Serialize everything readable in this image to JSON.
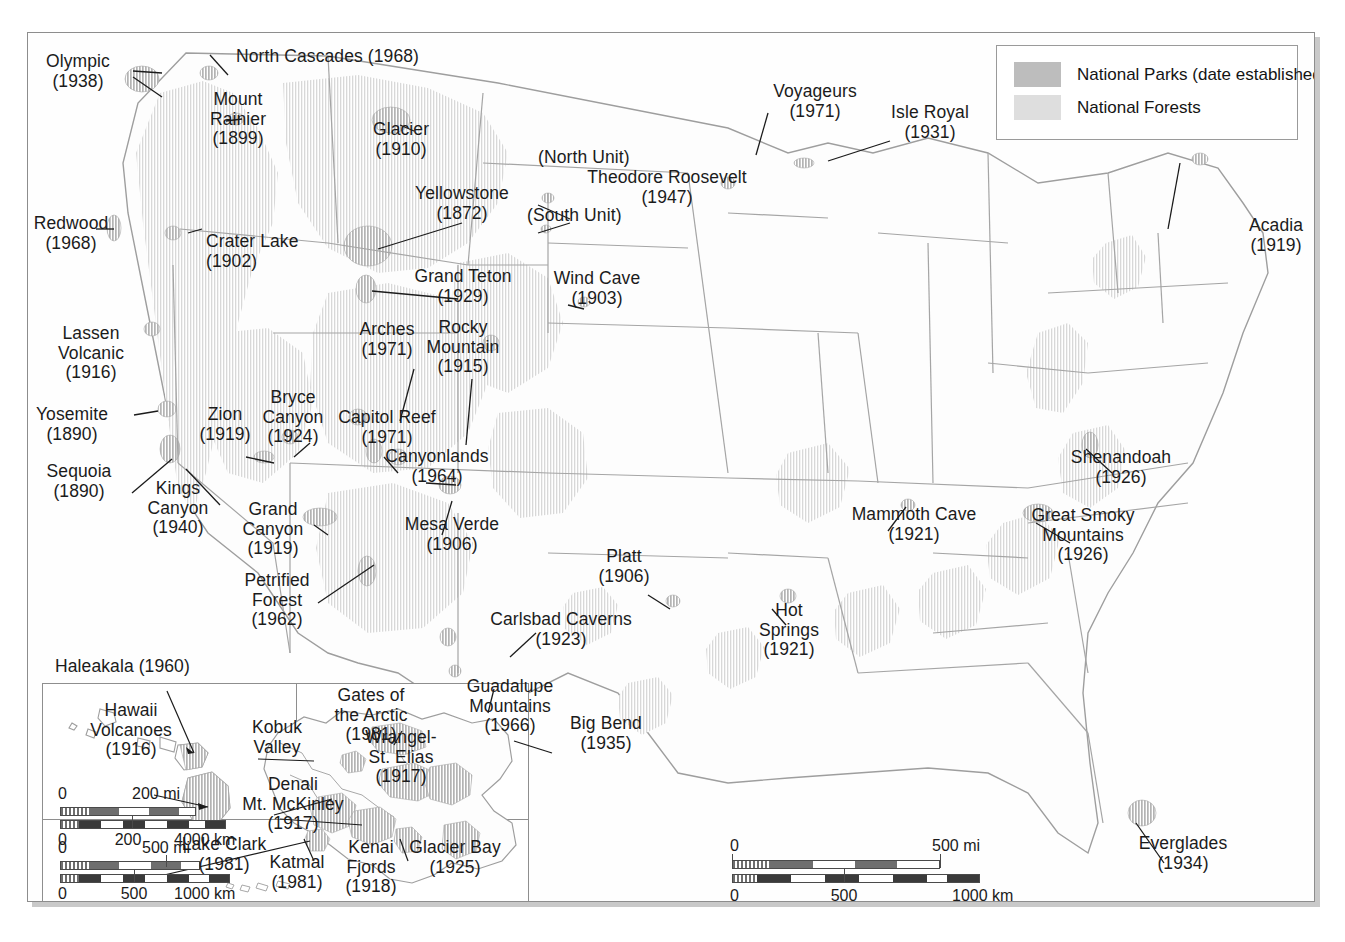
{
  "legend": {
    "items": [
      {
        "label": "National Parks (date established)",
        "color": "#bdbdbd",
        "icon": "park-swatch"
      },
      {
        "label": "National Forests",
        "color": "#dedede",
        "icon": "forest-swatch"
      }
    ]
  },
  "parks": [
    {
      "name": "Olympic",
      "year": "(1938)",
      "x": 78,
      "y": 52,
      "align": "c"
    },
    {
      "name": "North Cascades (1968)",
      "year": "",
      "x": 236,
      "y": 47,
      "align": "l"
    },
    {
      "name": "Mount\nRainier",
      "year": "(1899)",
      "x": 238,
      "y": 90,
      "align": "c"
    },
    {
      "name": "Glacier",
      "year": "(1910)",
      "x": 401,
      "y": 120,
      "align": "c"
    },
    {
      "name": "Voyageurs",
      "year": "(1971)",
      "x": 815,
      "y": 82,
      "align": "c"
    },
    {
      "name": "Isle Royal",
      "year": "(1931)",
      "x": 930,
      "y": 103,
      "align": "c"
    },
    {
      "name": "(North Unit)",
      "year": "",
      "x": 538,
      "y": 148,
      "align": "l"
    },
    {
      "name": "Theodore Roosevelt",
      "year": "(1947)",
      "x": 667,
      "y": 168,
      "align": "c"
    },
    {
      "name": "(South Unit)",
      "year": "",
      "x": 527,
      "y": 206,
      "align": "l"
    },
    {
      "name": "Yellowstone",
      "year": "(1872)",
      "x": 462,
      "y": 184,
      "align": "c"
    },
    {
      "name": "Acadia",
      "year": "(1919)",
      "x": 1276,
      "y": 216,
      "align": "c"
    },
    {
      "name": "Redwood",
      "year": "(1968)",
      "x": 71,
      "y": 214,
      "align": "c"
    },
    {
      "name": "Crater Lake",
      "year": "(1902)",
      "x": 206,
      "y": 232,
      "align": "l"
    },
    {
      "name": "Grand Teton",
      "year": "(1929)",
      "x": 463,
      "y": 267,
      "align": "c"
    },
    {
      "name": "Wind Cave",
      "year": "(1903)",
      "x": 597,
      "y": 269,
      "align": "c"
    },
    {
      "name": "Lassen\nVolcanic",
      "year": "(1916)",
      "x": 91,
      "y": 324,
      "align": "c"
    },
    {
      "name": "Arches",
      "year": "(1971)",
      "x": 387,
      "y": 320,
      "align": "c"
    },
    {
      "name": "Rocky\nMountain",
      "year": "(1915)",
      "x": 463,
      "y": 318,
      "align": "c"
    },
    {
      "name": "Yosemite",
      "year": "(1890)",
      "x": 72,
      "y": 405,
      "align": "c"
    },
    {
      "name": "Bryce\nCanyon",
      "year": "(1924)",
      "x": 293,
      "y": 388,
      "align": "c"
    },
    {
      "name": "Zion",
      "year": "(1919)",
      "x": 225,
      "y": 405,
      "align": "c"
    },
    {
      "name": "Capitol Reef",
      "year": "(1971)",
      "x": 387,
      "y": 408,
      "align": "c"
    },
    {
      "name": "Canyonlands",
      "year": "(1964)",
      "x": 437,
      "y": 447,
      "align": "c"
    },
    {
      "name": "Sequoia",
      "year": "(1890)",
      "x": 79,
      "y": 462,
      "align": "c"
    },
    {
      "name": "Kings\nCanyon",
      "year": "(1940)",
      "x": 178,
      "y": 479,
      "align": "c"
    },
    {
      "name": "Shenandoah",
      "year": "(1926)",
      "x": 1121,
      "y": 448,
      "align": "c"
    },
    {
      "name": "Grand\nCanyon",
      "year": "(1919)",
      "x": 273,
      "y": 500,
      "align": "c"
    },
    {
      "name": "Mesa Verde",
      "year": "(1906)",
      "x": 452,
      "y": 515,
      "align": "c"
    },
    {
      "name": "Mammoth Cave",
      "year": "(1921)",
      "x": 914,
      "y": 505,
      "align": "c"
    },
    {
      "name": "Great Smoky\nMountains",
      "year": "(1926)",
      "x": 1083,
      "y": 506,
      "align": "c"
    },
    {
      "name": "Platt",
      "year": "(1906)",
      "x": 624,
      "y": 547,
      "align": "c"
    },
    {
      "name": "Petrified\nForest",
      "year": "(1962)",
      "x": 277,
      "y": 571,
      "align": "c"
    },
    {
      "name": "Hot\nSprings",
      "year": "(1921)",
      "x": 789,
      "y": 601,
      "align": "c"
    },
    {
      "name": "Carlsbad Caverns",
      "year": "(1923)",
      "x": 561,
      "y": 610,
      "align": "c"
    },
    {
      "name": "Guadalupe\nMountains",
      "year": "(1966)",
      "x": 510,
      "y": 677,
      "align": "c"
    },
    {
      "name": "Big Bend",
      "year": "(1935)",
      "x": 606,
      "y": 714,
      "align": "c"
    },
    {
      "name": "Everglades",
      "year": "(1934)",
      "x": 1183,
      "y": 834,
      "align": "c"
    }
  ],
  "inset_labels": [
    {
      "name": "Haleakala (1960)",
      "year": "",
      "x": 55,
      "y": 657,
      "align": "l"
    },
    {
      "name": "Hawaii\nVolcanoes",
      "year": "(1916)",
      "x": 131,
      "y": 701,
      "align": "c"
    },
    {
      "name": "Gates of\nthe Arctic",
      "year": "(1981)",
      "x": 371,
      "y": 686,
      "align": "c"
    },
    {
      "name": "Kobuk\nValley",
      "year": "",
      "x": 277,
      "y": 718,
      "align": "c"
    },
    {
      "name": "Wrangel-\nSt. Elias",
      "year": "(1917)",
      "x": 401,
      "y": 728,
      "align": "c"
    },
    {
      "name": "Denali\nMt. McKinley",
      "year": "(1917)",
      "x": 293,
      "y": 775,
      "align": "c"
    },
    {
      "name": "Lake Clark",
      "year": "(1981)",
      "x": 224,
      "y": 835,
      "align": "c"
    },
    {
      "name": "Katmal",
      "year": "(1981)",
      "x": 297,
      "y": 853,
      "align": "c"
    },
    {
      "name": "Kenai\nFjords",
      "year": "(1918)",
      "x": 371,
      "y": 838,
      "align": "c"
    },
    {
      "name": "Glacier Bay",
      "year": "(1925)",
      "x": 455,
      "y": 838,
      "align": "c"
    }
  ],
  "scalebars": {
    "main": {
      "miles": {
        "zero": "0",
        "end": "500 mi"
      },
      "kilometers": {
        "zero": "0",
        "mid": "500",
        "end": "1000 km"
      }
    },
    "hawaii": {
      "miles": {
        "zero": "0",
        "end": "200 mi"
      },
      "kilometers": {
        "zero": "0",
        "mid": "200",
        "end": "4000 km"
      }
    },
    "alaska": {
      "miles": {
        "zero": "0",
        "end": "500 mi"
      },
      "kilometers": {
        "zero": "0",
        "mid": "500",
        "end": "1000 km"
      }
    }
  },
  "colors": {
    "park_fill": "#bdbdbd",
    "forest_fill": "#dedede",
    "border": "#9a9a9a",
    "state_line": "#9e9e9e",
    "label_text": "#1b1b1b",
    "page_bg": "#ffffff"
  }
}
